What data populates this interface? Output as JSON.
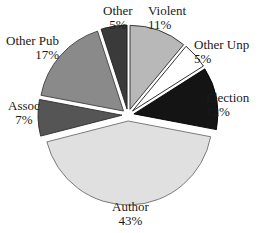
{
  "figure": {
    "cutoff_top_text": "Types of",
    "background_color": "#ffffff",
    "text_color": "#1a1a1a"
  },
  "chart_data": {
    "type": "pie",
    "title": "",
    "xlabel": "",
    "ylabel": "",
    "exploded": true,
    "legend_position": "none",
    "labels_outside": true,
    "categories": [
      "Violent",
      "Other Unp",
      "Election",
      "Author",
      "Assoc",
      "Other Pub",
      "Other"
    ],
    "values": [
      11,
      5,
      12,
      43,
      7,
      17,
      5
    ],
    "value_suffix": "%",
    "total": 100,
    "colors": [
      "#b8b8b8",
      "#ffffff",
      "#141414",
      "#e0e0e0",
      "#555555",
      "#8a8a8a",
      "#3a3a3a"
    ],
    "slices": [
      {
        "label": "Violent",
        "value": 11,
        "percent_text": "11%",
        "color": "#b8b8b8",
        "outline": "#2b2b2b"
      },
      {
        "label": "Other Unp",
        "value": 5,
        "percent_text": "5%",
        "color": "#ffffff",
        "outline": "#1a1a1a"
      },
      {
        "label": "Election",
        "value": 12,
        "percent_text": "12%",
        "color": "#141414",
        "outline": "#000000"
      },
      {
        "label": "Author",
        "value": 43,
        "percent_text": "43%",
        "color": "#e0e0e0",
        "outline": "#6e6e6e"
      },
      {
        "label": "Assoc",
        "value": 7,
        "percent_text": "7%",
        "color": "#555555",
        "outline": "#2b2b2b"
      },
      {
        "label": "Other Pub",
        "value": 17,
        "percent_text": "17%",
        "color": "#8a8a8a",
        "outline": "#3d3d3d"
      },
      {
        "label": "Other",
        "value": 5,
        "percent_text": "5%",
        "color": "#3a3a3a",
        "outline": "#1f1f1f"
      }
    ]
  }
}
